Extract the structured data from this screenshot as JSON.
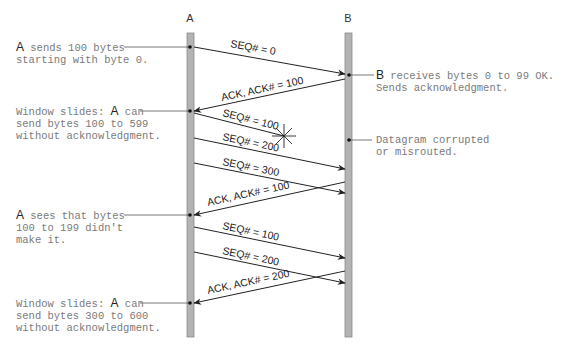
{
  "diagram": {
    "type": "sequence-diagram",
    "hosts": [
      {
        "id": "A",
        "label": "A",
        "x": 190
      },
      {
        "id": "B",
        "label": "B",
        "x": 348
      }
    ],
    "messages": [
      {
        "label": "SEQ# = 0",
        "from": "A",
        "to": "B",
        "y1": 47,
        "y2": 74,
        "lost": false
      },
      {
        "label": "ACK, ACK# = 100",
        "from": "B",
        "to": "A",
        "y1": 79,
        "y2": 111,
        "lost": false
      },
      {
        "label": "SEQ# = 100",
        "from": "A",
        "to": "lost",
        "y1": 113,
        "y2": 136,
        "lost": true
      },
      {
        "label": "SEQ# = 200",
        "from": "A",
        "to": "B",
        "y1": 138,
        "y2": 169,
        "lost": false
      },
      {
        "label": "SEQ# = 300",
        "from": "A",
        "to": "B",
        "y1": 163,
        "y2": 193,
        "lost": false
      },
      {
        "label": "ACK, ACK# = 100",
        "from": "B",
        "to": "A",
        "y1": 182,
        "y2": 215,
        "lost": false
      },
      {
        "label": "SEQ# = 100",
        "from": "A",
        "to": "B",
        "y1": 227,
        "y2": 258,
        "lost": false
      },
      {
        "label": "SEQ# = 200",
        "from": "A",
        "to": "B",
        "y1": 252,
        "y2": 283,
        "lost": false
      },
      {
        "label": "ACK, ACK# = 200",
        "from": "B",
        "to": "A",
        "y1": 271,
        "y2": 303,
        "lost": false
      }
    ],
    "annotations_left": [
      {
        "host": "A",
        "text": " sends 100 bytes\nstarting with byte 0.",
        "y": 47
      },
      {
        "host": "",
        "text": "Window slides: ",
        "host_inline": "A",
        "after": " can\nsend bytes 100 to 599\nwithout acknowledgment.",
        "y": 111
      },
      {
        "host": "A",
        "text": " sees that bytes\n100 to 199 didn't\nmake it.",
        "y": 215
      },
      {
        "host": "",
        "text": "Window slides: ",
        "host_inline": "A",
        "after": " can\nsend bytes 300 to 600\nwithout acknowledgment.",
        "y": 303
      }
    ],
    "annotations_right": [
      {
        "host": "B",
        "text": " receives bytes 0 to 99 OK.\nSends acknowledgment.",
        "y": 75
      },
      {
        "host": "",
        "text": "Datagram corrupted\nor misrouted.",
        "y": 140
      }
    ],
    "colors": {
      "lifeline_fill": "#b3b3b3",
      "lifeline_edge": "#8a8a8a",
      "arrow": "#222222",
      "note_text": "#7a7a7a",
      "connector": "#555555"
    }
  },
  "labels": {
    "host_a": "A",
    "host_b": "B",
    "msg0": "SEQ# = 0",
    "msg1": "ACK, ACK# = 100",
    "msg2": "SEQ# = 100",
    "msg3": "SEQ# = 200",
    "msg4": "SEQ# = 300",
    "msg5": "ACK, ACK# = 100",
    "msg6": "SEQ# = 100",
    "msg7": "SEQ# = 200",
    "msg8": "ACK, ACK# = 200",
    "note_l1_host": "A",
    "note_l1_rest": " sends 100 bytes\nstarting with byte 0.",
    "note_l2_pre": "Window slides: ",
    "note_l2_host": "A",
    "note_l2_rest": " can\nsend bytes 100 to 599\nwithout acknowledgment.",
    "note_l3_host": "A",
    "note_l3_rest": " sees that bytes\n100 to 199 didn't\nmake it.",
    "note_l4_pre": "Window slides: ",
    "note_l4_host": "A",
    "note_l4_rest": " can\nsend bytes 300 to 600\nwithout acknowledgment.",
    "note_r1_host": "B",
    "note_r1_rest": " receives bytes 0 to 99 OK.\nSends acknowledgment.",
    "note_r2": "Datagram corrupted\nor misrouted."
  }
}
